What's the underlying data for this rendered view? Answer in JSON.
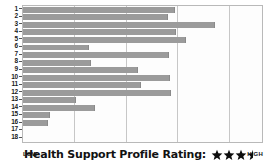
{
  "chart_data": {
    "type": "bar",
    "orientation": "horizontal",
    "title": "",
    "xlabel": "",
    "ylabel": "",
    "categories": [
      "1",
      "2",
      "3",
      "4",
      "5",
      "6",
      "7",
      "8",
      "9",
      "10",
      "11",
      "12",
      "13",
      "14",
      "15",
      "16",
      "17",
      "18"
    ],
    "values": [
      63.5,
      60.5,
      80.5,
      64.0,
      68.0,
      27.5,
      61.0,
      28.5,
      48.0,
      61.5,
      49.5,
      62.0,
      22.0,
      30.0,
      11.5,
      10.5,
      0,
      0
    ],
    "xlim": [
      0,
      100
    ],
    "gridlines": [
      21.5,
      43,
      64.5,
      86
    ],
    "grid": true,
    "legend": null,
    "bar_color": "#9b9b9b",
    "axis_low_label": "LOW",
    "axis_high_label": "HIGH"
  },
  "footer": {
    "low_label": "LOW",
    "high_label": "HIGH",
    "rating_label": "Health Support Profile Rating:",
    "rating_value": 3.5,
    "rating_max": 4
  },
  "colors": {
    "bar": "#9b9b9b",
    "grid": "#c7c7c7",
    "frame": "#b9b9b9",
    "plot_bg": "#fdfdfd",
    "text": "#111111"
  }
}
